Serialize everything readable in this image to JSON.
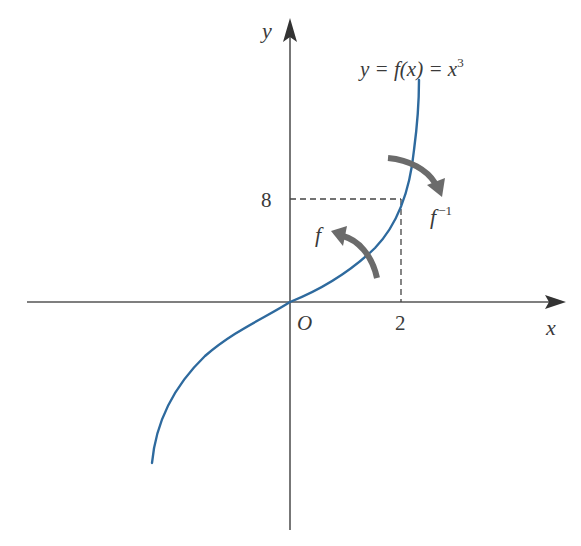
{
  "diagram": {
    "axes": {
      "x_label": "x",
      "y_label": "y",
      "origin_label": "O"
    },
    "curve": {
      "equation_label": "y = f(x) = x",
      "equation_exponent": "3",
      "color": "#2e6a9e"
    },
    "marked_point": {
      "x_tick": "2",
      "y_tick": "8"
    },
    "arrows": {
      "forward_label": "f",
      "inverse_label": "f",
      "inverse_exponent": "−1",
      "color": "#6b6b6b"
    }
  }
}
